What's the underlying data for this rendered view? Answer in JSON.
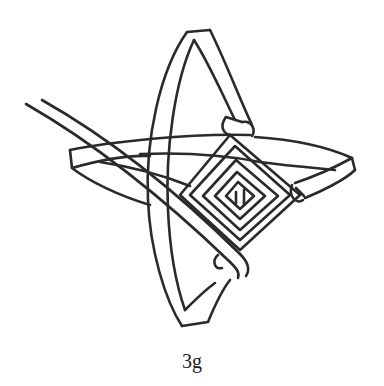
{
  "figure": {
    "caption": "3g",
    "colors": {
      "line": "#2a2a2a",
      "background": "#ffffff"
    }
  }
}
